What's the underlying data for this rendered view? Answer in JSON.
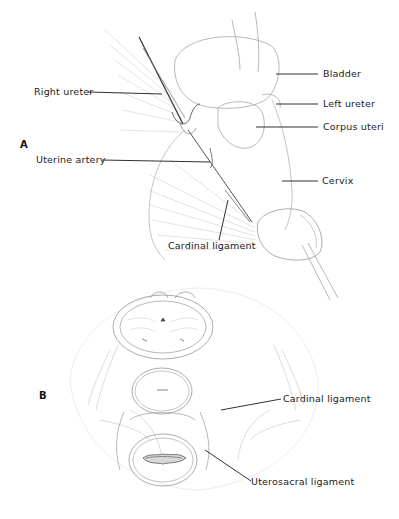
{
  "panels": [
    {
      "letter": "A",
      "labels": {
        "bladder": "Bladder",
        "left_ureter": "Left ureter",
        "corpus_uteri": "Corpus uteri",
        "cervix": "Cervix",
        "right_ureter": "Right ureter",
        "uterine_artery": "Uterine artery",
        "cardinal_ligament": "Cardinal ligament"
      }
    },
    {
      "letter": "B",
      "labels": {
        "cardinal_ligament": "Cardinal ligament",
        "uterosacral_ligament": "Uterosacral ligament"
      }
    }
  ]
}
